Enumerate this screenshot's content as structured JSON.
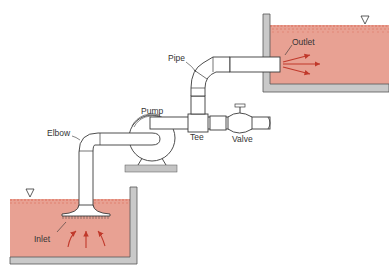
{
  "diagram": {
    "type": "piping-system",
    "labels": {
      "pipe": "Pipe",
      "outlet": "Outlet",
      "pump": "Pump",
      "elbow": "Elbow",
      "tee": "Tee",
      "valve": "Valve",
      "inlet": "Inlet"
    },
    "symbols": {
      "free_surface": "▽"
    },
    "colors": {
      "water": "#e8a193",
      "surface": "#d9604c",
      "wall": "#c9c9c9",
      "flow_arrow": "#c0392b",
      "line": "#3a3a3a"
    },
    "components": [
      "lower-reservoir",
      "inlet",
      "elbow",
      "pump",
      "tee",
      "valve",
      "pipe",
      "outlet",
      "upper-reservoir"
    ]
  }
}
